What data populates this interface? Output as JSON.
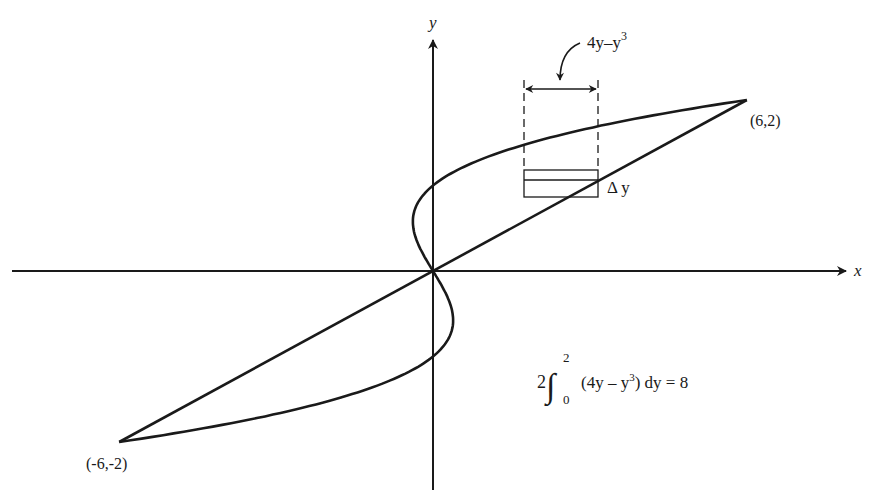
{
  "figure": {
    "type": "diagram",
    "axes": {
      "x_label": "x",
      "y_label": "y"
    },
    "points": [
      {
        "label": "(6,2)",
        "x": 6,
        "y": 2
      },
      {
        "label": "(-6,-2)",
        "x": -6,
        "y": -2
      }
    ],
    "curves": [
      {
        "name": "cubic",
        "equation": "x = y^3 - y"
      },
      {
        "name": "line",
        "equation": "x = 3y"
      }
    ],
    "strip": {
      "width_label_main": "4y–y",
      "width_label_exp": "3",
      "height_label": "Δ y"
    },
    "integral": {
      "coefficient": "2",
      "upper": "2",
      "lower": "0",
      "integrand": "(4y – y",
      "integrand_exp": "3",
      "integrand_tail": ") dy = 8"
    },
    "colors": {
      "ink": "#1a1a1a",
      "background": "#ffffff"
    }
  }
}
